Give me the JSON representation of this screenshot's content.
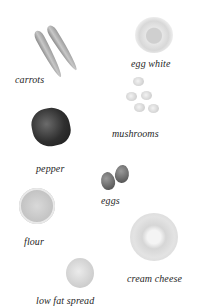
{
  "ingredients": [
    {
      "id": "carrots",
      "label": "carrots"
    },
    {
      "id": "egg-white",
      "label": "egg white"
    },
    {
      "id": "mushrooms",
      "label": "mushrooms"
    },
    {
      "id": "pepper",
      "label": "pepper"
    },
    {
      "id": "eggs",
      "label": "eggs"
    },
    {
      "id": "flour",
      "label": "flour"
    },
    {
      "id": "cream-cheese",
      "label": "cream cheese"
    },
    {
      "id": "low-fat-spread",
      "label": "low fat spread"
    }
  ],
  "colors": {
    "background": "#ffffff",
    "label_text": "#1f1f1f"
  }
}
